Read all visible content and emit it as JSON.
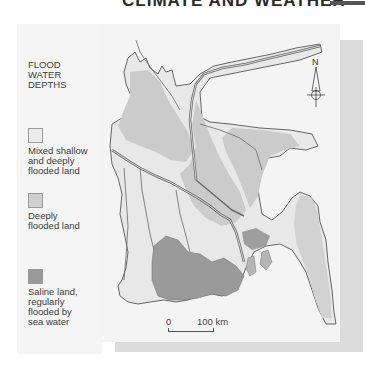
{
  "header": {
    "title": "CLIMATE AND WEATHER"
  },
  "legend": {
    "title_lines": [
      "FLOOD",
      "WATER",
      "DEPTHS"
    ],
    "items": [
      {
        "label_lines": [
          "Mixed shallow",
          "and deeply",
          "flooded land"
        ],
        "color": "#ececec"
      },
      {
        "label_lines": [
          "Deeply",
          "flooded land"
        ],
        "color": "#cfcfcf"
      },
      {
        "label_lines": [
          "Saline land,",
          "regularly",
          "flooded by",
          "sea water"
        ],
        "color": "#9a9a9a"
      }
    ]
  },
  "map": {
    "compass_label": "N",
    "scale": {
      "start_label": "0",
      "end_label": "100 km"
    },
    "colors": {
      "background": "#f4f4f4",
      "shadow": "#dcdcdc",
      "mixed": "#e8e8e8",
      "deep": "#cbcbcb",
      "saline": "#9a9a9a",
      "rivers": "#6a6a6a"
    }
  }
}
